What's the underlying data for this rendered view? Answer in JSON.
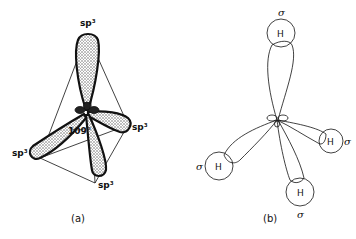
{
  "figure_a": {
    "caption": "(a)",
    "orbital_labels": [
      "sp³",
      "sp³",
      "sp³",
      "sp³"
    ],
    "angle_label": "109°"
  },
  "figure_b": {
    "caption": "(b)",
    "atom_labels": [
      "H",
      "H",
      "H",
      "H"
    ],
    "bond_labels": [
      "σ",
      "σ",
      "σ",
      "σ"
    ]
  },
  "colors": {
    "ink": "#111111",
    "shade": "#555555",
    "background": "#ffffff"
  }
}
